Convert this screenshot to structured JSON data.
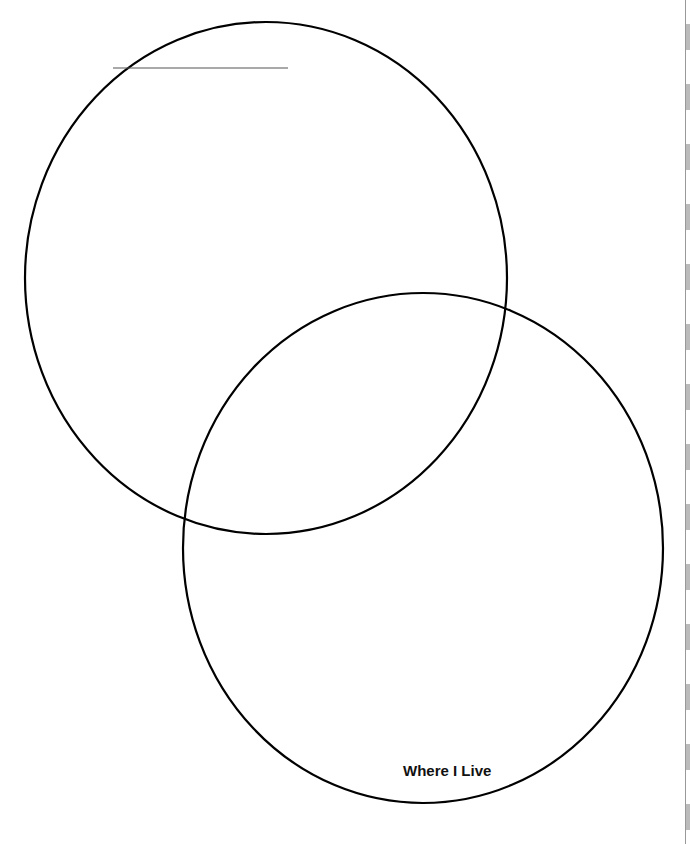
{
  "diagram": {
    "type": "venn",
    "circles": [
      {
        "id": "top-left",
        "label": ""
      },
      {
        "id": "bottom-right",
        "label": "Where I Live"
      }
    ],
    "title_blank": true,
    "stroke_color": "#000000",
    "blank_line_color": "#555555"
  }
}
